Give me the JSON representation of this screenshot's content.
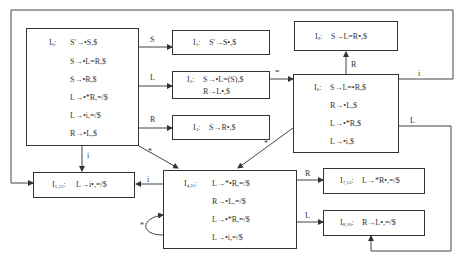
{
  "diagram": {
    "states": {
      "I0": {
        "label": "I",
        "sub": "0",
        "items": [
          "S'→•S,$",
          "S→•L=R,$",
          "S→•R,$",
          "L→•*R,=/$",
          "L→•i,=/$",
          "R→•L,$"
        ]
      },
      "I1": {
        "label": "I",
        "sub": "1",
        "items": [
          "S'→S•,$"
        ]
      },
      "I2": {
        "label": "I",
        "sub": "2",
        "items": [
          "S→•L=(S),$",
          "R→L•,$"
        ]
      },
      "I3": {
        "label": "I",
        "sub": "3",
        "items": [
          "S→R•,$"
        ]
      },
      "I9": {
        "label": "I",
        "sub": "9",
        "items": [
          "S→L=R•,$"
        ]
      },
      "I6": {
        "label": "I",
        "sub": "6",
        "items": [
          "S→L=•R,$",
          "R→•L,$",
          "L→•*R,$",
          "L→•i,$"
        ]
      },
      "I512": {
        "label": "I",
        "sub": "5,12",
        "items": [
          "L→i•,=/$"
        ]
      },
      "I411": {
        "label": "I",
        "sub": "4,11",
        "items": [
          "L→*•R,=/$",
          "R→•L,=/$",
          "L→•*R,=/$",
          "L→•i,=/$"
        ]
      },
      "I713": {
        "label": "I",
        "sub": "7,13",
        "items": [
          "L→*R•,=/$"
        ]
      },
      "I810": {
        "label": "I",
        "sub": "8,10",
        "items": [
          "R→L•,=/$"
        ]
      }
    },
    "edges": {
      "I0_I1": "S",
      "I0_I2": "L",
      "I0_I3": "R",
      "I2_I6": "=",
      "I6_I9": "R",
      "I6_I512": "i",
      "I6_I810": "L",
      "I6_I411": "*",
      "I0_I411": "*",
      "I0_I512": "i",
      "I411_I512": "i",
      "I411_I713": "R",
      "I411_I810": "L",
      "I411_self": "*"
    }
  }
}
